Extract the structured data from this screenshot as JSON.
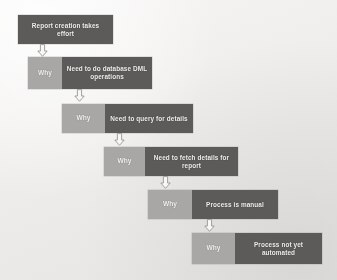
{
  "diagram": {
    "type": "five-whys-cascade",
    "title_box": {
      "label": "Report creation takes effort"
    },
    "why_label": "Why",
    "colors": {
      "background": "#f2f0ef",
      "why_box": "#a9a8a6",
      "statement_box": "#5b5a58",
      "text": "#f4f3f2",
      "arrow_stroke": "#8e8c8a",
      "arrow_fill": "#fbfbfa"
    },
    "steps": [
      {
        "why": "Why",
        "answer": "Need to do database  DML operations"
      },
      {
        "why": "Why",
        "answer": "Need to query for details"
      },
      {
        "why": "Why",
        "answer": "Need to fetch details for report"
      },
      {
        "why": "Why",
        "answer": "Process is manual"
      },
      {
        "why": "Why",
        "answer": "Process not yet automated"
      }
    ],
    "arrows": [
      {
        "name": "arrow-1"
      },
      {
        "name": "arrow-2"
      },
      {
        "name": "arrow-3"
      },
      {
        "name": "arrow-4"
      },
      {
        "name": "arrow-5"
      }
    ]
  }
}
